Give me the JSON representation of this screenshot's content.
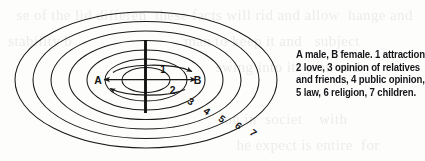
{
  "figure": {
    "kind": "concentric-ellipse-relationship-diagram",
    "ink_color": "#1a1a1a",
    "paper_color": "#fdfdfc"
  },
  "diagram": {
    "center_labels": {
      "left": "A",
      "right": "B"
    },
    "divider": {
      "name": "vertical-barrier"
    },
    "arrow_labels": {
      "one": "1",
      "two": "2"
    },
    "ring_labels": [
      "3",
      "4",
      "5",
      "6",
      "7"
    ]
  },
  "caption": {
    "lines": [
      "A male, B female. 1 attraction,",
      "2 love, 3 opinion of relatives",
      "and friends,  4 public opinion,",
      "5 law, 6 religion, 7 children."
    ],
    "full_text": "A male, B female. 1 attraction, 2 love, 3 opinion of relatives and friends, 4 public opinion, 5 law, 6 religion, 7 children."
  },
  "legend_meanings": [
    {
      "key": "A",
      "meaning": "male"
    },
    {
      "key": "B",
      "meaning": "female"
    },
    {
      "key": "1",
      "meaning": "attraction"
    },
    {
      "key": "2",
      "meaning": "love"
    },
    {
      "key": "3",
      "meaning": "opinion of relatives and friends"
    },
    {
      "key": "4",
      "meaning": "public opinion"
    },
    {
      "key": "5",
      "meaning": "law"
    },
    {
      "key": "6",
      "meaning": "religion"
    },
    {
      "key": "7",
      "meaning": "children"
    }
  ],
  "ghost_text": "background show-through of reverse page text"
}
